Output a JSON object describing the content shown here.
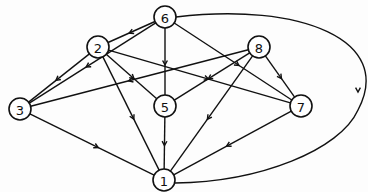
{
  "graph": {
    "type": "directed",
    "nodes": [
      {
        "id": "6",
        "label": "6",
        "x": 165,
        "y": 17
      },
      {
        "id": "2",
        "label": "2",
        "x": 98,
        "y": 47
      },
      {
        "id": "8",
        "label": "8",
        "x": 259,
        "y": 47
      },
      {
        "id": "3",
        "label": "3",
        "x": 20,
        "y": 109
      },
      {
        "id": "5",
        "label": "5",
        "x": 165,
        "y": 106
      },
      {
        "id": "7",
        "label": "7",
        "x": 301,
        "y": 106
      },
      {
        "id": "1",
        "label": "1",
        "x": 164,
        "y": 180
      }
    ],
    "edges": [
      {
        "from": "6",
        "to": "2"
      },
      {
        "from": "6",
        "to": "3"
      },
      {
        "from": "6",
        "to": "5"
      },
      {
        "from": "6",
        "to": "7"
      },
      {
        "from": "6",
        "to": "1",
        "curved": true
      },
      {
        "from": "2",
        "to": "3"
      },
      {
        "from": "2",
        "to": "5"
      },
      {
        "from": "2",
        "to": "7"
      },
      {
        "from": "2",
        "to": "1"
      },
      {
        "from": "8",
        "to": "3"
      },
      {
        "from": "8",
        "to": "5"
      },
      {
        "from": "8",
        "to": "1"
      },
      {
        "from": "8",
        "to": "7"
      },
      {
        "from": "3",
        "to": "1"
      },
      {
        "from": "5",
        "to": "1"
      },
      {
        "from": "7",
        "to": "1"
      }
    ]
  }
}
